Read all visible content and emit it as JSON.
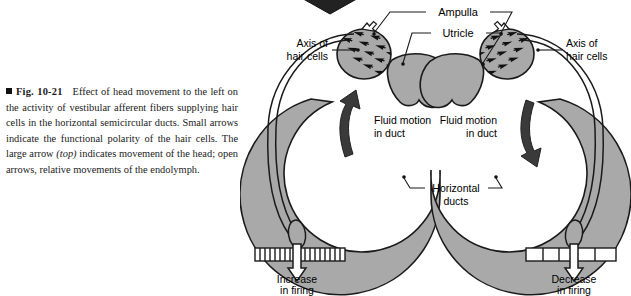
{
  "figure": {
    "number": "Fig. 10-21",
    "bullet": "filled-square-marker",
    "caption_text": "Effect of head movement to the left on the activity of vestibular afferent fibers supplying hair cells in the horizontal semicircular ducts. Small arrows indicate the functional polarity of the hair cells. The large arrow ",
    "caption_italic": "(top)",
    "caption_text_2": " indicates movement of the head; open arrows, relative movements of the endolymph."
  },
  "diagram": {
    "labels": {
      "ampulla": "Ampulla",
      "utricle": "Utricle",
      "axis_left_line1": "Axis of",
      "axis_left_line2": "hair cells",
      "axis_right_line1": "Axis of",
      "axis_right_line2": "hair cells",
      "fluid_left_line1": "Fluid motion",
      "fluid_left_line2": "in duct",
      "fluid_right_line1": "Fluid motion",
      "fluid_right_line2": "in duct",
      "horizontal_line1": "Horizontal",
      "horizontal_line2": "ducts",
      "firing_left_line1": "Increase",
      "firing_left_line2": "in firing",
      "firing_right_line1": "Decrease",
      "firing_right_line2": "in firing"
    },
    "spikes": {
      "left_count": 17,
      "right_count": 4
    },
    "colors": {
      "duct_fill": "#a9a9a9",
      "outline": "#1a1a1a",
      "arrow_dark": "#3a3a3a",
      "head_arrow": "#222222",
      "background": "#ffffff"
    }
  }
}
